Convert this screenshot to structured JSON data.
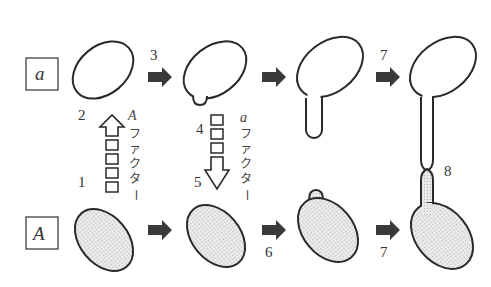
{
  "diagram": {
    "mating_types": {
      "top": "a",
      "bottom": "A"
    },
    "step_labels": {
      "s1": "1",
      "s2": "2",
      "s3": "3",
      "s4": "4",
      "s5": "5",
      "s6": "6",
      "s7_top": "7",
      "s7_bottom": "7",
      "s8": "8"
    },
    "factor_labels": {
      "upward": {
        "letter": "A",
        "chars": [
          "フ",
          "ァ",
          "ク",
          "タ",
          "ー"
        ]
      },
      "downward": {
        "letter": "a",
        "chars": [
          "フ",
          "ァ",
          "ク",
          "タ",
          "ー"
        ]
      }
    },
    "colors": {
      "outline": "#2a2a2a",
      "fill_A_cell": "#e4e4e4",
      "arrow": "#3a3a3a",
      "background": "#ffffff"
    }
  }
}
